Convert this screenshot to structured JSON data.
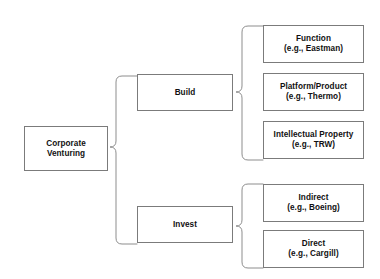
{
  "diagram": {
    "type": "hierarchy-tree",
    "title": "Corporate Venturing",
    "root": {
      "id": "corporate-venturing",
      "line1": "Corporate",
      "line2": "Venturing"
    },
    "branches": [
      {
        "id": "build",
        "label": "Build",
        "leaves": [
          {
            "id": "function",
            "line1": "Function",
            "line2": "(e.g., Eastman)"
          },
          {
            "id": "platform-product",
            "line1": "Platform/Product",
            "line2": "(e.g., Thermo)"
          },
          {
            "id": "intellectual-property",
            "line1": "Intellectual Property",
            "line2": "(e.g., TRW)"
          }
        ]
      },
      {
        "id": "invest",
        "label": "Invest",
        "leaves": [
          {
            "id": "indirect",
            "line1": "Indirect",
            "line2": "(e.g., Boeing)"
          },
          {
            "id": "direct",
            "line1": "Direct",
            "line2": "(e.g., Cargill)"
          }
        ]
      }
    ],
    "colors": {
      "background": "#ffffff",
      "box_border": "#7b7b7b",
      "brace_stroke": "#8d8d8d",
      "text": "#111111"
    }
  }
}
